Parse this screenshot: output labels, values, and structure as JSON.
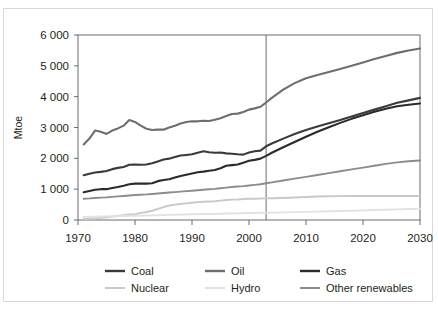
{
  "figure": {
    "title_partial": "",
    "frame_border_color": "#d9d9d9",
    "background": "#ffffff"
  },
  "chart_data": {
    "type": "line",
    "title": "",
    "subtitle": "",
    "xlabel": "",
    "ylabel": "Mtoe",
    "xlim": [
      1970,
      2030
    ],
    "ylim": [
      0,
      6000
    ],
    "xticks": [
      1970,
      1980,
      1990,
      2000,
      2010,
      2020,
      2030
    ],
    "xticklabels": [
      "1970",
      "1980",
      "1990",
      "2000",
      "2010",
      "2020",
      "2030"
    ],
    "yticks": [
      0,
      1000,
      2000,
      3000,
      4000,
      5000,
      6000
    ],
    "yticklabels": [
      "0",
      "1 000",
      "2 000",
      "3 000",
      "4 000",
      "5 000",
      "6 000"
    ],
    "grid": false,
    "legend_position": "bottom",
    "legend_columns": 3,
    "annotations": [
      {
        "name": "history-projection-divider",
        "type": "vline",
        "x": 2003,
        "label": "",
        "color": "#6b6b6b"
      }
    ],
    "x": [
      1971,
      1972,
      1973,
      1974,
      1975,
      1976,
      1977,
      1978,
      1979,
      1980,
      1981,
      1982,
      1983,
      1984,
      1985,
      1986,
      1987,
      1988,
      1989,
      1990,
      1991,
      1992,
      1993,
      1994,
      1995,
      1996,
      1997,
      1998,
      1999,
      2000,
      2001,
      2002,
      2003,
      2004,
      2006,
      2008,
      2010,
      2012,
      2014,
      2016,
      2018,
      2020,
      2022,
      2024,
      2026,
      2028,
      2030
    ],
    "series": [
      {
        "name": "Coal",
        "color": "#3a3a3a",
        "width": 2.1,
        "values": [
          1450,
          1500,
          1540,
          1560,
          1590,
          1650,
          1690,
          1720,
          1790,
          1800,
          1790,
          1800,
          1840,
          1900,
          1960,
          1990,
          2040,
          2090,
          2110,
          2130,
          2180,
          2230,
          2200,
          2180,
          2190,
          2160,
          2150,
          2130,
          2120,
          2190,
          2230,
          2250,
          2390,
          2480,
          2640,
          2790,
          2920,
          3030,
          3140,
          3240,
          3360,
          3470,
          3580,
          3690,
          3800,
          3880,
          3960
        ]
      },
      {
        "name": "Oil",
        "color": "#6e6e6e",
        "width": 2.1,
        "values": [
          2450,
          2640,
          2900,
          2860,
          2790,
          2900,
          2970,
          3060,
          3240,
          3180,
          3060,
          2960,
          2920,
          2930,
          2930,
          3000,
          3060,
          3130,
          3180,
          3200,
          3200,
          3220,
          3210,
          3250,
          3300,
          3370,
          3440,
          3450,
          3500,
          3580,
          3620,
          3670,
          3810,
          3960,
          4230,
          4440,
          4600,
          4700,
          4800,
          4900,
          5000,
          5110,
          5220,
          5320,
          5420,
          5500,
          5560
        ]
      },
      {
        "name": "Gas",
        "color": "#2b2b2b",
        "width": 2.1,
        "values": [
          900,
          940,
          980,
          1000,
          1000,
          1040,
          1070,
          1110,
          1160,
          1180,
          1180,
          1180,
          1190,
          1260,
          1300,
          1320,
          1380,
          1430,
          1470,
          1510,
          1550,
          1570,
          1600,
          1620,
          1680,
          1760,
          1780,
          1800,
          1860,
          1920,
          1950,
          1990,
          2080,
          2180,
          2360,
          2530,
          2700,
          2860,
          3010,
          3150,
          3280,
          3400,
          3510,
          3610,
          3690,
          3740,
          3780
        ]
      },
      {
        "name": "Nuclear",
        "color": "#c9c9c9",
        "width": 1.9,
        "values": [
          30,
          40,
          50,
          70,
          90,
          110,
          130,
          160,
          180,
          190,
          230,
          260,
          300,
          360,
          420,
          470,
          500,
          520,
          540,
          560,
          580,
          590,
          600,
          610,
          630,
          650,
          660,
          665,
          680,
          690,
          690,
          695,
          700,
          705,
          715,
          730,
          745,
          760,
          770,
          775,
          778,
          780,
          780,
          780,
          780,
          780,
          780
        ]
      },
      {
        "name": "Hydro",
        "color": "#e2e2e2",
        "width": 1.9,
        "values": [
          100,
          105,
          110,
          115,
          118,
          122,
          126,
          130,
          135,
          140,
          143,
          146,
          150,
          155,
          160,
          165,
          170,
          175,
          180,
          185,
          190,
          193,
          196,
          200,
          205,
          210,
          213,
          216,
          220,
          225,
          228,
          231,
          235,
          240,
          248,
          256,
          264,
          272,
          282,
          292,
          302,
          312,
          322,
          334,
          346,
          358,
          370
        ]
      },
      {
        "name": "Other renewables",
        "color": "#8c8c8c",
        "width": 1.9,
        "values": [
          690,
          700,
          715,
          725,
          735,
          750,
          765,
          780,
          795,
          810,
          820,
          830,
          845,
          860,
          875,
          890,
          905,
          920,
          935,
          950,
          965,
          980,
          995,
          1010,
          1030,
          1050,
          1070,
          1085,
          1100,
          1120,
          1140,
          1160,
          1190,
          1220,
          1280,
          1340,
          1400,
          1460,
          1520,
          1580,
          1640,
          1700,
          1760,
          1820,
          1870,
          1905,
          1930
        ]
      }
    ]
  },
  "legend": {
    "rows": [
      [
        {
          "label": "Coal",
          "color": "#3a3a3a",
          "width": 2.4
        },
        {
          "label": "Oil",
          "color": "#6e6e6e",
          "width": 2.4
        },
        {
          "label": "Gas",
          "color": "#2b2b2b",
          "width": 2.4
        }
      ],
      [
        {
          "label": "Nuclear",
          "color": "#c9c9c9",
          "width": 2.0
        },
        {
          "label": "Hydro",
          "color": "#e2e2e2",
          "width": 2.0
        },
        {
          "label": "Other renewables",
          "color": "#8c8c8c",
          "width": 2.0
        }
      ]
    ]
  },
  "axes": {
    "axis_color": "#6b6b6b",
    "tick_color": "#6b6b6b"
  }
}
